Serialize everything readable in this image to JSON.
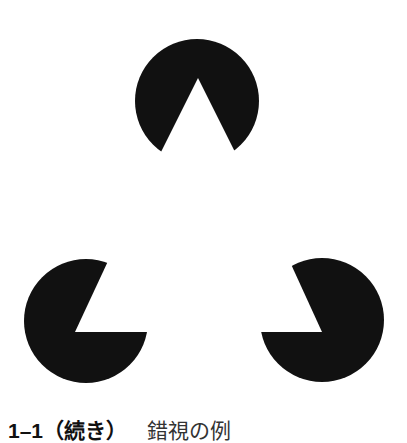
{
  "figure": {
    "fill_color": "#111111",
    "background_color": "#ffffff",
    "pacmen": [
      {
        "name": "top",
        "cx": 197,
        "cy": 101,
        "r": 62,
        "wedge": [
          [
            198,
            78
          ],
          [
            159,
            156
          ],
          [
            237,
            156
          ]
        ]
      },
      {
        "name": "bottom-left",
        "cx": 86,
        "cy": 321,
        "r": 62,
        "wedge": [
          [
            75,
            332
          ],
          [
            109,
            259
          ],
          [
            148,
            332
          ]
        ]
      },
      {
        "name": "bottom-right",
        "cx": 322,
        "cy": 320,
        "r": 62,
        "wedge": [
          [
            322,
            332
          ],
          [
            290,
            262
          ],
          [
            260,
            332
          ]
        ]
      }
    ]
  },
  "caption": {
    "number": "1–1",
    "continued": "（続き）",
    "title": "錯視の例"
  }
}
